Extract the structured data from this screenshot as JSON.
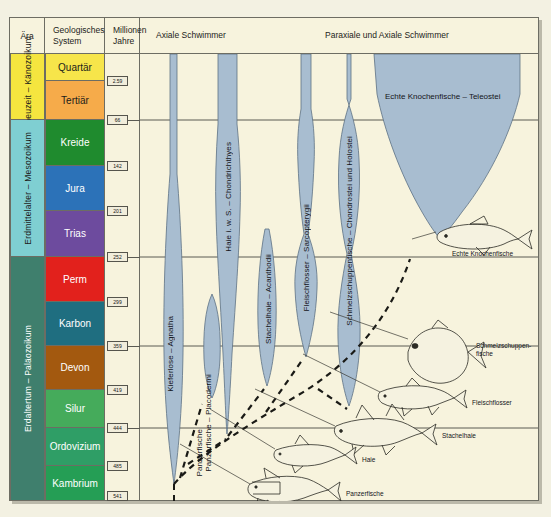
{
  "headers": {
    "era": "Ära",
    "system": "Geologisches System",
    "ma": "Millionen Jahre",
    "axial": "Axiale Schwimmer",
    "paraxial": "Paraxiale und Axiale Schwimmer"
  },
  "eras": [
    {
      "label": "Erdneuzeit – Känozoikum",
      "color": "#f5e53f",
      "text_color": "#1d1d1a",
      "top": 0,
      "height": 66
    },
    {
      "label": "Erdmittelalter – Mesozoikum",
      "color": "#7fcfd2",
      "text_color": "#1d1d1a",
      "top": 66,
      "height": 137
    },
    {
      "label": "Erdaltertum – Paläozoikum",
      "color": "#3f7f6d",
      "text_color": "#ffffff",
      "top": 203,
      "height": 244
    }
  ],
  "systems": [
    {
      "label": "Quartär",
      "color": "#f7e54a",
      "text_color": "#1d1d1a",
      "top": 0,
      "height": 27
    },
    {
      "label": "Tertiär",
      "color": "#f6ab4a",
      "text_color": "#1d1d1a",
      "top": 27,
      "height": 39
    },
    {
      "label": "Kreide",
      "color": "#1f8b2e",
      "text_color": "#ffffff",
      "top": 66,
      "height": 46
    },
    {
      "label": "Jura",
      "color": "#2c72b8",
      "text_color": "#ffffff",
      "top": 112,
      "height": 45
    },
    {
      "label": "Trias",
      "color": "#6d4b9e",
      "text_color": "#ffffff",
      "top": 157,
      "height": 46
    },
    {
      "label": "Perm",
      "color": "#e2211c",
      "text_color": "#ffffff",
      "top": 203,
      "height": 45
    },
    {
      "label": "Karbon",
      "color": "#1f6e80",
      "text_color": "#ffffff",
      "top": 248,
      "height": 44
    },
    {
      "label": "Devon",
      "color": "#a3590f",
      "text_color": "#ffffff",
      "top": 292,
      "height": 44
    },
    {
      "label": "Silur",
      "color": "#45ab5b",
      "text_color": "#ffffff",
      "top": 336,
      "height": 38
    },
    {
      "label": "Ordovizium",
      "color": "#2f9e66",
      "text_color": "#ffffff",
      "top": 374,
      "height": 38
    },
    {
      "label": "Kambrium",
      "color": "#259e55",
      "text_color": "#ffffff",
      "top": 412,
      "height": 35
    }
  ],
  "ma_ticks": [
    {
      "value": "2.59",
      "top": 27
    },
    {
      "value": "66",
      "top": 66
    },
    {
      "value": "142",
      "top": 112
    },
    {
      "value": "201",
      "top": 157
    },
    {
      "value": "252",
      "top": 203
    },
    {
      "value": "299",
      "top": 248
    },
    {
      "value": "359",
      "top": 292
    },
    {
      "value": "419",
      "top": 336
    },
    {
      "value": "444",
      "top": 374
    },
    {
      "value": "485",
      "top": 412
    },
    {
      "value": "541",
      "top": 442
    }
  ],
  "clades": [
    {
      "name": "Kieferlose – Agnatha",
      "x": 31,
      "y": 150
    },
    {
      "name": "Panzerfische – Placodermi",
      "x": 63,
      "y": 295
    },
    {
      "name": "Haie i. w. S. – Chondrichthyes",
      "x": 82,
      "y": 80
    },
    {
      "name": "Stachelhaie – Acanthodii",
      "x": 130,
      "y": 180
    },
    {
      "name": "Fleischflosser – Sarcopterygii",
      "x": 168,
      "y": 80
    },
    {
      "name": "Schmelzschuppenfische – Chondrostei und Holostei",
      "x": 220,
      "y": 80
    },
    {
      "name": "Echte Knochenfische – Teleostei",
      "x": 0,
      "y": 0
    }
  ],
  "teleostei_label": "Echte Knochenfische – Teleostei",
  "specimens": [
    {
      "label": "Echte Knochenfische",
      "x": 298,
      "y": 196
    },
    {
      "label": "Schmelzschuppen-\nfische",
      "x": 318,
      "y": 322
    },
    {
      "label": "Fleischflosser",
      "x": 290,
      "y": 358
    },
    {
      "label": "Stachelhaie",
      "x": 258,
      "y": 388
    },
    {
      "label": "Haie",
      "x": 190,
      "y": 416
    },
    {
      "label": "Panzerfische",
      "x": 205,
      "y": 447
    },
    {
      "label": "Kieferlose",
      "x": 100,
      "y": 478
    }
  ],
  "colors": {
    "paper": "#f7f3dd",
    "clade_fill": "#a8bdd0",
    "clade_stroke": "#5d7184",
    "rule": "#6d6d63",
    "page_bg": "#f3f1e2"
  }
}
